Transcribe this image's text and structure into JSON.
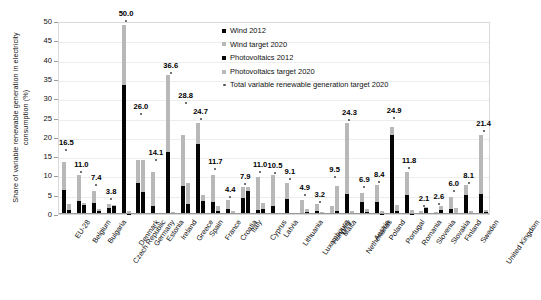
{
  "chart_data": {
    "type": "bar",
    "title": "",
    "xlabel": "",
    "ylabel": "Share of variable renewable generation in electricity consumption (%)",
    "ylim": [
      0,
      50
    ],
    "ytick_step": 5,
    "yticks": [
      "0",
      "5",
      "10",
      "15",
      "20",
      "25",
      "30",
      "35",
      "40",
      "45",
      "50"
    ],
    "grid": true,
    "legend_position": "upper-right-inside",
    "legend": [
      "Wind 2012",
      "Wind target 2020",
      "Photovoltaics 2012",
      "Photovoltaics target 2020",
      "Total variable renewable generation target 2020"
    ],
    "categories": [
      "EU-28",
      "Belgium",
      "Bulgaria",
      "Czech Republic",
      "Denmark",
      "Germany",
      "Estonia",
      "Ireland",
      "Greece",
      "Spain",
      "France",
      "Croatia",
      "Italy",
      "Cyprus",
      "Latvia",
      "Lithuania",
      "Luxembourg",
      "Hungary",
      "Malta",
      "Netherlands",
      "Austria",
      "Poland",
      "Portugal",
      "Romania",
      "Slovenia",
      "Slovakia",
      "Finland",
      "Sweden",
      "United Kingdom"
    ],
    "series": [
      {
        "name": "Wind 2012",
        "color": "#050505",
        "values": [
          6.3,
          3.3,
          2.8,
          1.5,
          33.5,
          8.1,
          2.0,
          16.0,
          7.3,
          18.1,
          3.1,
          1.2,
          4.2,
          1.0,
          2.2,
          3.8,
          0.3,
          0.8,
          0.0,
          5.1,
          3.2,
          3.1,
          20.5,
          4.8,
          0.0,
          0.0,
          1.4,
          5.0,
          5.1
        ]
      },
      {
        "name": "Wind target 2020",
        "color": "#b8b8b8",
        "values": [
          13.5,
          10.0,
          5.9,
          2.7,
          49.0,
          14.0,
          11.0,
          36.0,
          20.5,
          23.5,
          10.0,
          3.6,
          7.0,
          9.5,
          10.0,
          8.0,
          3.6,
          2.6,
          2.2,
          23.5,
          5.5,
          7.6,
          22.5,
          10.8,
          0.7,
          0.6,
          4.4,
          7.4,
          20.4
        ]
      },
      {
        "name": "Photovoltaics 2012",
        "color": "#050505",
        "values": [
          1.1,
          2.4,
          0.9,
          2.1,
          0.1,
          5.6,
          0.0,
          0.0,
          2.7,
          3.5,
          0.7,
          0.0,
          6.0,
          1.3,
          0.0,
          0.0,
          0.6,
          0.2,
          0.9,
          0.2,
          0.6,
          0.1,
          0.9,
          0.1,
          1.5,
          1.0,
          0.0,
          0.0,
          0.5
        ]
      },
      {
        "name": "Photovoltaics target 2020",
        "color": "#b8b8b8",
        "values": [
          2.6,
          2.9,
          1.4,
          2.3,
          0.9,
          14.1,
          0.0,
          0.4,
          8.0,
          5.0,
          2.0,
          0.8,
          6.9,
          2.9,
          0.3,
          0.2,
          1.3,
          0.6,
          7.3,
          0.8,
          1.4,
          0.8,
          2.4,
          1.0,
          1.9,
          2.0,
          1.6,
          0.7,
          1.0
        ]
      }
    ],
    "total_target_labels": [
      "16.5",
      "11.0",
      "7.4",
      "3.8",
      "50.0",
      "26.0",
      "14.1",
      "36.6",
      "28.8",
      "24.7",
      "11.7",
      "4.4",
      "7.9",
      "11.0",
      "10.5",
      "9.1",
      "4.9",
      "3.2",
      "9.5",
      "24.3",
      "6.9",
      "8.4",
      "24.9",
      "11.8",
      "2.1",
      "2.6",
      "6.0",
      "8.1",
      "21.4"
    ],
    "total_target_values": [
      16.5,
      11.0,
      7.4,
      3.8,
      50.0,
      26.0,
      14.1,
      36.6,
      28.8,
      24.7,
      11.7,
      4.4,
      7.9,
      11.0,
      10.5,
      9.1,
      4.9,
      3.2,
      9.5,
      24.3,
      6.9,
      8.4,
      24.9,
      11.8,
      2.1,
      2.6,
      6.0,
      8.1,
      21.4
    ]
  }
}
